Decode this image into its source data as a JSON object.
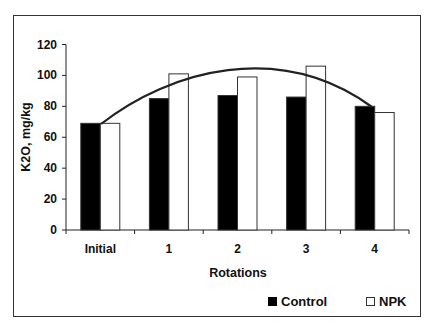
{
  "chart_data": {
    "type": "bar",
    "title": "",
    "xlabel": "Rotations",
    "ylabel": "K2O, mg/kg",
    "ylim": [
      0,
      120
    ],
    "yticks": [
      0,
      20,
      40,
      60,
      80,
      100,
      120
    ],
    "categories": [
      "Initial",
      "1",
      "2",
      "3",
      "4"
    ],
    "series": [
      {
        "name": "Control",
        "color": "#000000",
        "values": [
          69,
          85,
          87,
          86,
          80
        ]
      },
      {
        "name": "NPK",
        "color": "#ffffff",
        "values": [
          69,
          101,
          99,
          106,
          76
        ]
      }
    ],
    "trendline": {
      "type": "polynomial",
      "description": "Curve rising from Initial to a peak near rotation 2 then declining to rotation 4",
      "approx_points": [
        [
          0.5,
          69
        ],
        [
          1,
          93
        ],
        [
          2,
          107
        ],
        [
          3,
          98
        ],
        [
          4,
          80
        ]
      ]
    },
    "legend_position": "bottom-right",
    "grid": false
  },
  "legend": {
    "control": "Control",
    "npk": "NPK"
  }
}
